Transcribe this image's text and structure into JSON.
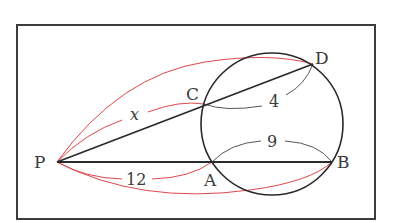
{
  "diagram": {
    "type": "geometry-secant-theorem",
    "colors": {
      "frame": "#3c3c3c",
      "line": "#2a2a2a",
      "circle": "#2a2a2a",
      "bracket_red": "#e0474c",
      "bracket_gray": "#555555",
      "text": "#3a3a3a"
    },
    "points": {
      "P": {
        "label": "P"
      },
      "A": {
        "label": "A"
      },
      "B": {
        "label": "B"
      },
      "C": {
        "label": "C"
      },
      "D": {
        "label": "D"
      }
    },
    "lengths": {
      "PC": "x",
      "CD": "4",
      "PA": "12",
      "AB": "9"
    }
  }
}
